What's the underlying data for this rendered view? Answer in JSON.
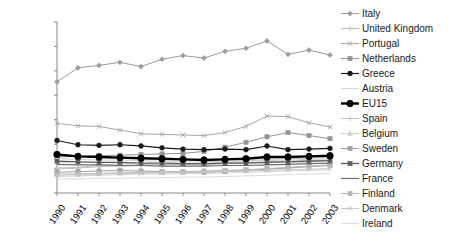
{
  "chart_data": {
    "type": "line",
    "title": "",
    "xlabel": "",
    "ylabel": "",
    "categories": [
      "1990",
      "1991",
      "1992",
      "1993",
      "1994",
      "1995",
      "1996",
      "1997",
      "1998",
      "1999",
      "2000",
      "2001",
      "2002",
      "2003"
    ],
    "ylim": [
      0,
      14
    ],
    "ytick_labels": [
      "0.00",
      "2.00",
      "4.00",
      "6.00",
      "8.00",
      "10.00",
      "12.00",
      "14.00"
    ],
    "ytick_values": [
      0,
      2,
      4,
      6,
      8,
      10,
      12,
      14
    ],
    "grid": false,
    "legend_position": "right",
    "series": [
      {
        "name": "Italy",
        "color": "#9c9c9c",
        "marker": "diamond",
        "width": 1,
        "values": [
          9.1,
          10.25,
          10.45,
          10.7,
          10.35,
          10.95,
          11.25,
          11.05,
          11.6,
          11.85,
          12.45,
          11.35,
          11.7,
          11.3
        ]
      },
      {
        "name": "United Kingdom",
        "color": "#bdbdbd",
        "marker": "plus",
        "width": 1,
        "values": [
          1.95,
          2.05,
          2.15,
          2.2,
          2.25,
          2.3,
          2.35,
          2.3,
          2.4,
          2.45,
          2.55,
          2.6,
          2.65,
          2.7
        ]
      },
      {
        "name": "Portugal",
        "color": "#a8a8a8",
        "marker": "cross",
        "width": 1,
        "values": [
          5.7,
          5.5,
          5.45,
          5.15,
          4.85,
          4.8,
          4.75,
          4.7,
          4.95,
          5.45,
          6.3,
          6.25,
          5.75,
          5.4
        ]
      },
      {
        "name": "Netherlands",
        "color": "#949494",
        "marker": "square",
        "width": 1,
        "values": [
          2.95,
          3.0,
          3.05,
          3.1,
          3.15,
          3.2,
          3.25,
          3.4,
          3.75,
          4.15,
          4.6,
          4.95,
          4.7,
          4.45
        ]
      },
      {
        "name": "Greece",
        "color": "#1a1a1a",
        "marker": "circle",
        "width": 1.2,
        "values": [
          4.3,
          3.95,
          3.9,
          3.95,
          3.85,
          3.7,
          3.6,
          3.55,
          3.6,
          3.55,
          3.85,
          3.55,
          3.6,
          3.65
        ]
      },
      {
        "name": "Austria",
        "color": "#d6d6d6",
        "marker": "none",
        "width": 1,
        "values": [
          1.35,
          1.4,
          1.45,
          1.5,
          1.55,
          1.55,
          1.6,
          1.6,
          1.65,
          1.7,
          1.75,
          1.8,
          1.85,
          1.9
        ]
      },
      {
        "name": "EU15",
        "color": "#000000",
        "marker": "circle-bold",
        "width": 2.4,
        "values": [
          3.15,
          3.0,
          2.95,
          2.9,
          2.85,
          2.8,
          2.75,
          2.7,
          2.75,
          2.8,
          2.95,
          2.95,
          3.0,
          3.05
        ]
      },
      {
        "name": "Spain",
        "color": "#c4c4c4",
        "marker": "plus",
        "width": 1,
        "values": [
          2.05,
          2.1,
          2.25,
          2.4,
          2.35,
          2.3,
          2.35,
          2.4,
          2.5,
          2.6,
          2.75,
          2.8,
          2.85,
          2.9
        ]
      },
      {
        "name": "Belgium",
        "color": "#cfcfcf",
        "marker": "triangle",
        "width": 1,
        "values": [
          2.8,
          2.75,
          2.7,
          2.7,
          2.65,
          2.6,
          2.55,
          2.55,
          2.6,
          2.6,
          2.65,
          2.7,
          2.75,
          2.8
        ]
      },
      {
        "name": "Sweden",
        "color": "#a0a0a0",
        "marker": "square",
        "width": 1,
        "values": [
          1.7,
          1.75,
          1.8,
          1.85,
          1.8,
          1.75,
          1.7,
          1.7,
          1.75,
          1.85,
          1.95,
          2.05,
          2.15,
          2.25
        ]
      },
      {
        "name": "Germany",
        "color": "#5a5a5a",
        "marker": "cross-filled",
        "width": 1.3,
        "values": [
          2.6,
          2.55,
          2.5,
          2.5,
          2.45,
          2.45,
          2.4,
          2.4,
          2.45,
          2.45,
          2.5,
          2.55,
          2.6,
          2.65
        ]
      },
      {
        "name": "France",
        "color": "#6e6e6e",
        "marker": "none",
        "width": 1.2,
        "values": [
          2.35,
          2.3,
          2.3,
          2.25,
          2.25,
          2.2,
          2.2,
          2.2,
          2.25,
          2.25,
          2.3,
          2.35,
          2.4,
          2.45
        ]
      },
      {
        "name": "Finland",
        "color": "#b5b5b5",
        "marker": "square",
        "width": 1,
        "values": [
          1.55,
          1.55,
          1.6,
          1.65,
          1.7,
          1.7,
          1.75,
          1.8,
          1.85,
          1.9,
          2.0,
          2.1,
          2.2,
          2.3
        ]
      },
      {
        "name": "Denmark",
        "color": "#c9c9c9",
        "marker": "cross",
        "width": 1,
        "values": [
          1.45,
          1.5,
          1.55,
          1.6,
          1.6,
          1.65,
          1.65,
          1.7,
          1.75,
          1.8,
          1.85,
          1.9,
          1.95,
          2.0
        ]
      },
      {
        "name": "Ireland",
        "color": "#dcdcdc",
        "marker": "none",
        "width": 1,
        "values": [
          1.15,
          1.15,
          1.2,
          1.2,
          1.25,
          1.25,
          1.3,
          1.3,
          1.35,
          1.4,
          1.45,
          1.5,
          1.55,
          1.6
        ]
      }
    ]
  },
  "legend": {
    "items": [
      {
        "label": "Italy"
      },
      {
        "label": "United Kingdom"
      },
      {
        "label": "Portugal"
      },
      {
        "label": "Netherlands"
      },
      {
        "label": "Greece"
      },
      {
        "label": "Austria"
      },
      {
        "label": "EU15"
      },
      {
        "label": "Spain"
      },
      {
        "label": "Belgium"
      },
      {
        "label": "Sweden"
      },
      {
        "label": "Germany"
      },
      {
        "label": "France"
      },
      {
        "label": "Finland"
      },
      {
        "label": "Denmark"
      },
      {
        "label": "Ireland"
      }
    ]
  },
  "axis": {
    "frame_color": "#888888",
    "text_color": "#000000"
  }
}
